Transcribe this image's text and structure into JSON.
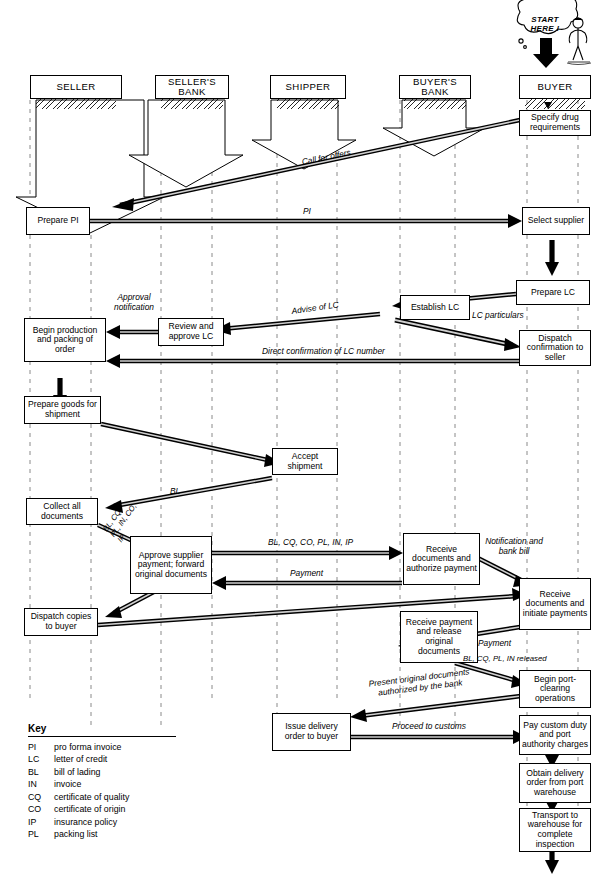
{
  "diagram": {
    "title_cut": "",
    "type": "swimlane-flowchart",
    "start_marker": "START HERE !",
    "lanes": [
      {
        "id": "seller",
        "label": "SELLER"
      },
      {
        "id": "sellers_bank",
        "label": "SELLER'S BANK"
      },
      {
        "id": "shipper",
        "label": "SHIPPER"
      },
      {
        "id": "buyers_bank",
        "label": "BUYER'S BANK"
      },
      {
        "id": "buyer",
        "label": "BUYER"
      }
    ],
    "nodes": [
      {
        "id": "n_specify",
        "text": "Specify drug requirements",
        "lane": "buyer"
      },
      {
        "id": "n_preparepi",
        "text": "Prepare PI",
        "lane": "seller"
      },
      {
        "id": "n_select",
        "text": "Select supplier",
        "lane": "buyer"
      },
      {
        "id": "n_preparelc",
        "text": "Prepare LC",
        "lane": "buyer"
      },
      {
        "id": "n_establish",
        "text": "Establish LC",
        "lane": "buyers_bank"
      },
      {
        "id": "n_review",
        "text": "Review and approve LC",
        "lane": "sellers_bank"
      },
      {
        "id": "n_begin",
        "text": "Begin production and packing of order",
        "lane": "seller"
      },
      {
        "id": "n_dispatchconf",
        "text": "Dispatch confirmation to seller",
        "lane": "buyer"
      },
      {
        "id": "n_goods",
        "text": "Prepare goods for shipment",
        "lane": "seller"
      },
      {
        "id": "n_accept",
        "text": "Accept shipment",
        "lane": "shipper"
      },
      {
        "id": "n_collect",
        "text": "Collect all documents",
        "lane": "seller"
      },
      {
        "id": "n_approve",
        "text": "Approve supplier payment; forward original documents",
        "lane": "sellers_bank"
      },
      {
        "id": "n_recdocs",
        "text": "Receive documents and authorize payment",
        "lane": "buyers_bank"
      },
      {
        "id": "n_recinit",
        "text": "Receive documents and initiate payments",
        "lane": "buyer"
      },
      {
        "id": "n_dispatchcopies",
        "text": "Dispatch copies to buyer",
        "lane": "seller"
      },
      {
        "id": "n_recpay",
        "text": "Receive payment and release original documents",
        "lane": "buyers_bank"
      },
      {
        "id": "n_portclear",
        "text": "Begin port-clearing operations",
        "lane": "buyer"
      },
      {
        "id": "n_issuedel",
        "text": "Issue delivery order to buyer",
        "lane": "shipper"
      },
      {
        "id": "n_paycustom",
        "text": "Pay custom duty and port authority charges",
        "lane": "buyer"
      },
      {
        "id": "n_obtaindel",
        "text": "Obtain delivery order from port warehouse",
        "lane": "buyer"
      },
      {
        "id": "n_transport",
        "text": "Transport to warehouse for complete inspection",
        "lane": "buyer"
      }
    ],
    "edge_labels": [
      {
        "id": "e_call",
        "text": "Call for offers"
      },
      {
        "id": "e_pi",
        "text": "PI"
      },
      {
        "id": "e_advise",
        "text": "Advise of LC"
      },
      {
        "id": "e_approval",
        "text": "Approval notification"
      },
      {
        "id": "e_lcpart",
        "text": "LC particulars"
      },
      {
        "id": "e_direct",
        "text": "Direct confirmation of LC number"
      },
      {
        "id": "e_bl",
        "text": "BL"
      },
      {
        "id": "e_docs_diag",
        "text": "BL, CQ, PL, IN, CO, IP"
      },
      {
        "id": "e_docs_top",
        "text": "BL, CQ, CO, PL, IN, IP"
      },
      {
        "id": "e_payment1",
        "text": "Payment"
      },
      {
        "id": "e_notif",
        "text": "Notification and bank bill"
      },
      {
        "id": "e_payment2",
        "text": "Payment"
      },
      {
        "id": "e_released",
        "text": "BL, CQ, PL, IN released"
      },
      {
        "id": "e_present",
        "text": "Present original documents authorized by the bank"
      },
      {
        "id": "e_proceed",
        "text": "Proceed to customs"
      }
    ]
  },
  "key": {
    "title": "Key",
    "entries": [
      {
        "abbr": "PI",
        "def": "pro forma invoice"
      },
      {
        "abbr": "LC",
        "def": "letter of credit"
      },
      {
        "abbr": "BL",
        "def": "bill of lading"
      },
      {
        "abbr": "IN",
        "def": "invoice"
      },
      {
        "abbr": "CQ",
        "def": "certificate of quality"
      },
      {
        "abbr": "CO",
        "def": "certificate of origin"
      },
      {
        "abbr": "IP",
        "def": "insurance policy"
      },
      {
        "abbr": "PL",
        "def": "packing list"
      }
    ]
  },
  "colors": {
    "ink": "#000000",
    "paper": "#ffffff",
    "dash": "#8a8a8a"
  }
}
